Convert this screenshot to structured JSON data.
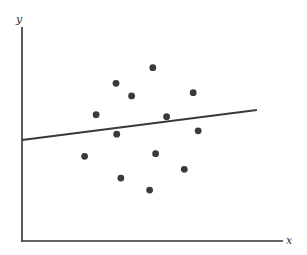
{
  "chart_data": {
    "type": "scatter",
    "title": "",
    "xlabel": "x",
    "ylabel": "y",
    "xlim": [
      0,
      10
    ],
    "ylim": [
      0,
      10
    ],
    "grid": false,
    "legend": null,
    "ticks": false,
    "series": [
      {
        "name": "points",
        "kind": "scatter",
        "color": "#3a3a3a",
        "x": [
          5.01,
          3.6,
          4.2,
          6.56,
          2.84,
          5.54,
          3.63,
          6.75,
          2.4,
          5.12,
          6.22,
          3.79,
          4.89
        ],
        "y": [
          8.1,
          7.37,
          6.78,
          6.93,
          5.9,
          5.81,
          4.99,
          5.15,
          3.96,
          4.08,
          3.35,
          2.94,
          2.38
        ]
      },
      {
        "name": "fitted line",
        "kind": "line",
        "color": "#3a3a3a",
        "x": [
          0.0,
          9.0
        ],
        "y": [
          4.72,
          6.12
        ]
      }
    ]
  },
  "axes": {
    "x_label": "x",
    "y_label": "y",
    "color": "#333333"
  }
}
